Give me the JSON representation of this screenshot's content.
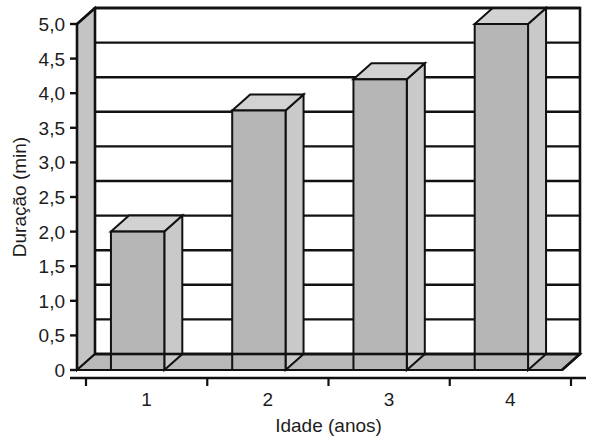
{
  "chart_data": {
    "type": "bar",
    "title": "",
    "subtitle": "",
    "xlabel": "Idade (anos)",
    "ylabel": "Duração (min)",
    "categories": [
      "1",
      "2",
      "3",
      "4"
    ],
    "values": [
      2.0,
      3.75,
      4.2,
      5.0
    ],
    "series": [
      {
        "name": "Duração (min)",
        "values": [
          2.0,
          3.75,
          4.2,
          5.0
        ]
      }
    ],
    "ylim": [
      0,
      5.0
    ],
    "ytick_values": [
      0,
      0.5,
      1.0,
      1.5,
      2.0,
      2.5,
      3.0,
      3.5,
      4.0,
      4.5,
      5.0
    ],
    "ytick_labels": [
      "0",
      "0,5",
      "1,0",
      "1,5",
      "2,0",
      "2,5",
      "3,0",
      "3,5",
      "4,0",
      "4,5",
      "5,0"
    ],
    "xtick_labels": [
      "1",
      "2",
      "3",
      "4"
    ],
    "grid": "horizontal",
    "legend": "none",
    "style": "3d-bars-grayscale",
    "decimal_separator": ",",
    "annotations": []
  },
  "colors": {
    "bar_front": "#b6b6b6",
    "bar_top": "#d2d2d2",
    "bar_side": "#c9c9c9",
    "wall": "#c4c4c4",
    "floor": "#b9b9b9",
    "plot_bg": "#ffffff",
    "line": "#111111",
    "text": "#1d1d1d",
    "page_bg": "#ffffff"
  }
}
